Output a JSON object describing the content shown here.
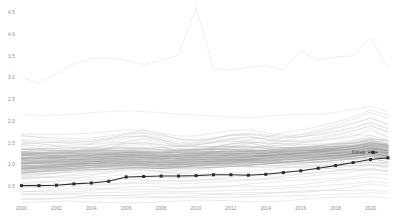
{
  "chart": {
    "title": "",
    "subtitle": "",
    "highlight_label": "Korea",
    "colors": {
      "background": "#ffffff",
      "faint_series": "#c9c9c9",
      "dense_series": "#9a9a9a",
      "pale_series": "#dcdcdc",
      "highlight": "#2b2b2b",
      "tick_text": "#8a8a8a",
      "legend_text": "#4a4a4a"
    }
  },
  "chart_data": {
    "type": "line",
    "title": "",
    "xlabel": "",
    "ylabel": "",
    "xlim": [
      2000,
      2021
    ],
    "ylim": [
      0.0,
      4.75
    ],
    "grid": false,
    "legend_position": "inline-right",
    "x_ticks": [
      "2000",
      "2002",
      "2004",
      "2006",
      "2008",
      "2010",
      "2012",
      "2014",
      "2016",
      "2018",
      "2020"
    ],
    "x_tick_values": [
      2000,
      2002,
      2004,
      2006,
      2008,
      2010,
      2012,
      2014,
      2016,
      2018,
      2020
    ],
    "y_ticks": [
      "4.5",
      "4.0",
      "3.5",
      "3.0",
      "2.5",
      "2.0",
      "1.5",
      "1.0",
      "0.5"
    ],
    "y_tick_values": [
      4.5,
      4.0,
      3.5,
      3.0,
      2.5,
      2.0,
      1.5,
      1.0,
      0.5
    ],
    "x": [
      2000,
      2001,
      2002,
      2003,
      2004,
      2005,
      2006,
      2007,
      2008,
      2009,
      2010,
      2011,
      2012,
      2013,
      2014,
      2015,
      2016,
      2017,
      2018,
      2019,
      2020,
      2021
    ],
    "highlight_series": {
      "name": "Korea",
      "marker": "square",
      "values": [
        0.52,
        0.52,
        0.53,
        0.56,
        0.58,
        0.62,
        0.72,
        0.73,
        0.74,
        0.74,
        0.75,
        0.77,
        0.77,
        0.76,
        0.78,
        0.82,
        0.86,
        0.92,
        0.98,
        1.05,
        1.12,
        1.16
      ]
    },
    "series": [
      {
        "name": "top-outlier",
        "style": "pale",
        "values": [
          3.02,
          2.88,
          3.1,
          3.32,
          3.44,
          3.46,
          3.4,
          3.3,
          3.4,
          3.52,
          4.62,
          3.2,
          3.18,
          3.24,
          3.28,
          3.18,
          3.62,
          3.4,
          3.48,
          3.5,
          3.92,
          3.22
        ]
      },
      {
        "name": "second-high",
        "style": "pale",
        "values": [
          2.18,
          2.12,
          2.14,
          2.16,
          2.2,
          2.22,
          2.24,
          2.22,
          2.2,
          2.16,
          2.14,
          2.12,
          2.1,
          2.08,
          2.12,
          2.14,
          2.16,
          2.16,
          2.2,
          2.28,
          2.34,
          2.22
        ]
      },
      {
        "name": "mid-high-a",
        "style": "pale",
        "values": [
          1.48,
          1.5,
          1.52,
          1.55,
          1.58,
          1.62,
          1.7,
          1.72,
          1.66,
          1.58,
          1.55,
          1.58,
          1.7,
          1.72,
          1.64,
          1.56,
          1.52,
          1.55,
          1.6,
          1.64,
          1.84,
          1.62
        ]
      },
      {
        "name": "mid-high-b",
        "style": "pale",
        "values": [
          1.46,
          1.44,
          1.42,
          1.46,
          1.5,
          1.52,
          1.5,
          1.48,
          1.46,
          1.44,
          1.46,
          1.5,
          1.54,
          1.52,
          1.5,
          1.48,
          1.5,
          1.56,
          1.62,
          1.7,
          1.66,
          1.58
        ]
      },
      {
        "name": "band-01",
        "style": "dense",
        "values": [
          1.3,
          1.3,
          1.29,
          1.3,
          1.31,
          1.32,
          1.33,
          1.32,
          1.31,
          1.33,
          1.34,
          1.35,
          1.36,
          1.35,
          1.34,
          1.36,
          1.38,
          1.4,
          1.42,
          1.44,
          1.52,
          1.46
        ]
      },
      {
        "name": "band-02",
        "style": "dense",
        "values": [
          1.26,
          1.25,
          1.25,
          1.26,
          1.27,
          1.28,
          1.28,
          1.27,
          1.26,
          1.28,
          1.29,
          1.3,
          1.31,
          1.3,
          1.3,
          1.32,
          1.34,
          1.36,
          1.38,
          1.4,
          1.46,
          1.4
        ]
      },
      {
        "name": "band-03",
        "style": "dense",
        "values": [
          1.22,
          1.22,
          1.21,
          1.22,
          1.23,
          1.24,
          1.25,
          1.24,
          1.22,
          1.24,
          1.26,
          1.27,
          1.28,
          1.27,
          1.27,
          1.28,
          1.3,
          1.32,
          1.34,
          1.37,
          1.44,
          1.38
        ]
      },
      {
        "name": "band-04",
        "style": "dense",
        "values": [
          1.18,
          1.18,
          1.18,
          1.19,
          1.2,
          1.21,
          1.22,
          1.21,
          1.19,
          1.21,
          1.23,
          1.24,
          1.25,
          1.24,
          1.24,
          1.26,
          1.28,
          1.3,
          1.32,
          1.35,
          1.42,
          1.36
        ]
      },
      {
        "name": "band-05",
        "style": "dense",
        "values": [
          1.14,
          1.14,
          1.14,
          1.15,
          1.16,
          1.18,
          1.19,
          1.18,
          1.16,
          1.18,
          1.2,
          1.21,
          1.22,
          1.21,
          1.22,
          1.24,
          1.26,
          1.28,
          1.3,
          1.33,
          1.4,
          1.34
        ]
      },
      {
        "name": "band-06",
        "style": "dense",
        "values": [
          1.1,
          1.1,
          1.11,
          1.12,
          1.13,
          1.15,
          1.16,
          1.15,
          1.13,
          1.15,
          1.17,
          1.18,
          1.19,
          1.19,
          1.2,
          1.22,
          1.24,
          1.26,
          1.28,
          1.31,
          1.38,
          1.32
        ]
      },
      {
        "name": "band-07",
        "style": "dense",
        "values": [
          1.06,
          1.07,
          1.08,
          1.09,
          1.1,
          1.12,
          1.13,
          1.12,
          1.1,
          1.12,
          1.14,
          1.15,
          1.16,
          1.16,
          1.18,
          1.2,
          1.22,
          1.24,
          1.26,
          1.29,
          1.36,
          1.3
        ]
      },
      {
        "name": "band-08",
        "style": "dense",
        "values": [
          1.02,
          1.03,
          1.04,
          1.06,
          1.07,
          1.09,
          1.1,
          1.09,
          1.07,
          1.09,
          1.11,
          1.12,
          1.13,
          1.14,
          1.16,
          1.18,
          1.2,
          1.22,
          1.24,
          1.27,
          1.33,
          1.27
        ]
      },
      {
        "name": "band-09",
        "style": "dense",
        "values": [
          0.98,
          0.99,
          1.0,
          1.02,
          1.04,
          1.06,
          1.07,
          1.06,
          1.04,
          1.06,
          1.08,
          1.1,
          1.11,
          1.12,
          1.14,
          1.16,
          1.18,
          1.2,
          1.22,
          1.25,
          1.3,
          1.24
        ]
      },
      {
        "name": "band-10",
        "style": "dense",
        "values": [
          0.94,
          0.96,
          0.97,
          0.99,
          1.01,
          1.03,
          1.04,
          1.03,
          1.01,
          1.03,
          1.05,
          1.07,
          1.08,
          1.09,
          1.11,
          1.13,
          1.15,
          1.18,
          1.2,
          1.23,
          1.28,
          1.22
        ]
      },
      {
        "name": "band-11",
        "style": "dense",
        "values": [
          0.9,
          0.92,
          0.94,
          0.96,
          0.98,
          1.0,
          1.01,
          1.0,
          0.98,
          1.0,
          1.02,
          1.04,
          1.05,
          1.06,
          1.08,
          1.11,
          1.13,
          1.16,
          1.18,
          1.21,
          1.26,
          1.2
        ]
      },
      {
        "name": "band-12",
        "style": "dense",
        "values": [
          0.86,
          0.88,
          0.9,
          0.92,
          0.95,
          0.97,
          0.98,
          0.97,
          0.95,
          0.97,
          0.99,
          1.01,
          1.02,
          1.03,
          1.06,
          1.08,
          1.1,
          1.13,
          1.16,
          1.19,
          1.23,
          1.17
        ]
      },
      {
        "name": "band-13",
        "style": "dense",
        "values": [
          0.82,
          0.85,
          0.87,
          0.9,
          0.92,
          0.94,
          0.95,
          0.94,
          0.92,
          0.94,
          0.96,
          0.98,
          1.0,
          1.01,
          1.03,
          1.06,
          1.08,
          1.11,
          1.14,
          1.17,
          1.21,
          1.14
        ]
      },
      {
        "name": "rising-a",
        "style": "faint",
        "values": [
          0.74,
          0.78,
          0.82,
          0.86,
          0.9,
          0.95,
          0.99,
          1.02,
          1.0,
          0.99,
          1.03,
          1.08,
          1.12,
          1.16,
          1.2,
          1.24,
          1.28,
          1.33,
          1.38,
          1.44,
          1.52,
          1.48
        ]
      },
      {
        "name": "rising-b",
        "style": "faint",
        "values": [
          0.66,
          0.7,
          0.74,
          0.78,
          0.83,
          0.88,
          0.93,
          0.96,
          0.94,
          0.93,
          0.98,
          1.03,
          1.08,
          1.12,
          1.16,
          1.21,
          1.26,
          1.31,
          1.36,
          1.42,
          1.5,
          1.44
        ]
      },
      {
        "name": "falling-a",
        "style": "faint",
        "values": [
          1.42,
          1.38,
          1.34,
          1.32,
          1.3,
          1.28,
          1.26,
          1.24,
          1.22,
          1.2,
          1.18,
          1.16,
          1.14,
          1.12,
          1.1,
          1.08,
          1.06,
          1.05,
          1.04,
          1.04,
          1.06,
          1.02
        ]
      },
      {
        "name": "falling-b",
        "style": "faint",
        "values": [
          1.36,
          1.33,
          1.3,
          1.27,
          1.24,
          1.22,
          1.2,
          1.18,
          1.16,
          1.14,
          1.12,
          1.1,
          1.08,
          1.06,
          1.04,
          1.02,
          1.0,
          0.99,
          0.98,
          0.98,
          1.0,
          0.96
        ]
      },
      {
        "name": "hump-a",
        "style": "faint",
        "values": [
          1.12,
          1.16,
          1.22,
          1.3,
          1.38,
          1.46,
          1.54,
          1.58,
          1.52,
          1.42,
          1.44,
          1.52,
          1.58,
          1.56,
          1.48,
          1.4,
          1.36,
          1.38,
          1.42,
          1.46,
          1.58,
          1.44
        ]
      },
      {
        "name": "hump-b",
        "style": "faint",
        "values": [
          1.04,
          1.08,
          1.14,
          1.22,
          1.3,
          1.38,
          1.44,
          1.46,
          1.4,
          1.32,
          1.34,
          1.4,
          1.46,
          1.44,
          1.38,
          1.32,
          1.3,
          1.34,
          1.4,
          1.46,
          1.54,
          1.42
        ]
      },
      {
        "name": "low-a",
        "style": "faint",
        "values": [
          0.6,
          0.61,
          0.62,
          0.64,
          0.66,
          0.68,
          0.7,
          0.71,
          0.7,
          0.7,
          0.72,
          0.74,
          0.76,
          0.78,
          0.8,
          0.83,
          0.86,
          0.89,
          0.93,
          0.97,
          1.02,
          0.98
        ]
      },
      {
        "name": "low-b",
        "style": "faint",
        "values": [
          0.46,
          0.47,
          0.48,
          0.5,
          0.52,
          0.54,
          0.56,
          0.57,
          0.56,
          0.56,
          0.58,
          0.6,
          0.62,
          0.64,
          0.66,
          0.69,
          0.72,
          0.76,
          0.8,
          0.84,
          0.9,
          0.86
        ]
      },
      {
        "name": "low-c",
        "style": "faint",
        "values": [
          0.32,
          0.32,
          0.33,
          0.34,
          0.35,
          0.36,
          0.37,
          0.38,
          0.38,
          0.38,
          0.39,
          0.4,
          0.41,
          0.42,
          0.44,
          0.46,
          0.48,
          0.51,
          0.54,
          0.57,
          0.62,
          0.58
        ]
      },
      {
        "name": "low-flat",
        "style": "faint",
        "values": [
          0.22,
          0.22,
          0.22,
          0.23,
          0.23,
          0.24,
          0.24,
          0.24,
          0.24,
          0.24,
          0.25,
          0.25,
          0.26,
          0.26,
          0.27,
          0.28,
          0.29,
          0.3,
          0.32,
          0.33,
          0.36,
          0.34
        ]
      },
      {
        "name": "cross-a",
        "style": "faint",
        "values": [
          1.58,
          1.56,
          1.52,
          1.48,
          1.46,
          1.5,
          1.6,
          1.68,
          1.62,
          1.52,
          1.5,
          1.54,
          1.6,
          1.62,
          1.58,
          1.54,
          1.56,
          1.62,
          1.7,
          1.78,
          1.9,
          1.74
        ]
      },
      {
        "name": "cross-b",
        "style": "faint",
        "values": [
          1.66,
          1.64,
          1.62,
          1.6,
          1.62,
          1.66,
          1.72,
          1.74,
          1.68,
          1.6,
          1.58,
          1.62,
          1.68,
          1.7,
          1.66,
          1.62,
          1.64,
          1.7,
          1.78,
          1.86,
          1.96,
          1.82
        ]
      },
      {
        "name": "mid-wander",
        "style": "faint",
        "values": [
          1.2,
          1.26,
          1.18,
          1.24,
          1.16,
          1.22,
          1.3,
          1.24,
          1.18,
          1.26,
          1.2,
          1.28,
          1.22,
          1.3,
          1.24,
          1.32,
          1.26,
          1.34,
          1.28,
          1.36,
          1.44,
          1.32
        ]
      },
      {
        "name": "steep-rise",
        "style": "faint",
        "values": [
          0.88,
          0.9,
          0.94,
          1.0,
          1.06,
          1.14,
          1.22,
          1.28,
          1.24,
          1.2,
          1.26,
          1.34,
          1.42,
          1.48,
          1.54,
          1.62,
          1.7,
          1.8,
          1.92,
          2.04,
          2.2,
          2.06
        ]
      }
    ]
  },
  "legend": {
    "items": [
      {
        "label": "Korea",
        "marker": "square",
        "color": "#2b2b2b"
      }
    ]
  }
}
